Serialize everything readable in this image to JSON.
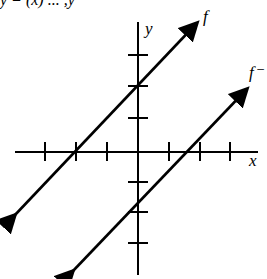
{
  "diagram": {
    "top_fragment": "y = (x) ... ,y",
    "axes": {
      "x_label": "x",
      "y_label": "y",
      "origin_px": [
        138,
        152
      ],
      "unit_px": 31,
      "x_ticks": [
        -3,
        -2,
        -1,
        1,
        2,
        3
      ],
      "y_ticks": [
        -3,
        -2,
        -1,
        1,
        2,
        3
      ]
    },
    "lines": [
      {
        "name": "f",
        "label": "f",
        "x_intercept": -2,
        "y_intercept": 2,
        "slope": 1,
        "color": "#000000"
      },
      {
        "name": "f-inverse",
        "label": "f⁻",
        "x_intercept": 2,
        "y_intercept": -2,
        "slope": 1,
        "color": "#000000"
      }
    ]
  }
}
